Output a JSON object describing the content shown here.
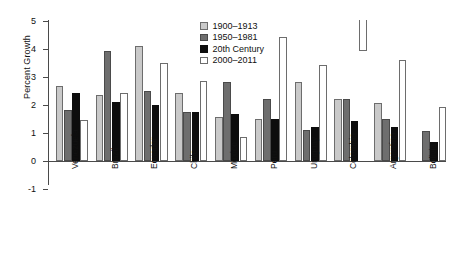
{
  "chart_data": {
    "type": "bar",
    "title": "",
    "xlabel": "",
    "ylabel": "Percent Growth",
    "ylim": [
      -1,
      5
    ],
    "yticks": [
      -1,
      0,
      1,
      2,
      3,
      4,
      5
    ],
    "ytick_labels": [
      "-1",
      "0",
      "1",
      "2",
      "3",
      "4",
      "5"
    ],
    "grid": false,
    "legend_position": "top-center",
    "categories": [
      "Venezuela",
      "Brazil",
      "Ecuador",
      "Chile",
      "Mexico",
      "Peru",
      "Uruguay",
      "Colombia",
      "Argentina",
      "Bolivia"
    ],
    "series": [
      {
        "name": "1900–1913",
        "color": "#c9c9c9",
        "values": [
          2.65,
          2.35,
          4.1,
          2.4,
          1.55,
          1.5,
          2.8,
          2.2,
          2.05,
          null
        ]
      },
      {
        "name": "1950–1981",
        "color": "#6e6e6e",
        "values": [
          1.8,
          3.9,
          2.5,
          1.75,
          2.8,
          2.2,
          1.1,
          2.2,
          1.5,
          1.05
        ]
      },
      {
        "name": "20th Century",
        "color": "#0d0d0d",
        "values": [
          2.4,
          2.1,
          2.0,
          1.75,
          1.65,
          1.5,
          1.2,
          1.4,
          1.2,
          0.65
        ]
      },
      {
        "name": "2000–2011",
        "color": "#ffffff",
        "values": [
          1.45,
          2.4,
          3.5,
          2.85,
          0.85,
          4.4,
          3.4,
          -1.1,
          3.6,
          1.9
        ]
      }
    ]
  }
}
